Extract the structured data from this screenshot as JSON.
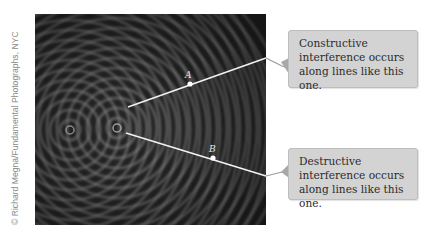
{
  "figure": {
    "credit": "© Richard Megna/Fundamental Photographs, NYC",
    "photo_description": "Ripple tank interference pattern from two point sources",
    "points": [
      {
        "label": "A",
        "x": 190,
        "y": 84
      },
      {
        "label": "B",
        "x": 213,
        "y": 158
      }
    ],
    "callouts": [
      {
        "id": "constructive",
        "text": "Constructive interference occurs along lines like this one."
      },
      {
        "id": "destructive",
        "text": "Destructive interference occurs along lines like this one."
      }
    ],
    "colors": {
      "callout_bg": "#d3d3d3",
      "callout_border": "#bdbdbd",
      "line": "#f2f2f2",
      "leader": "#9a9a9a",
      "photo_bg": "#1e1e1e"
    }
  }
}
